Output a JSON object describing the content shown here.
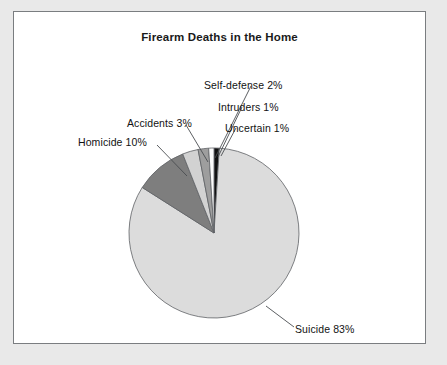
{
  "chart_data": {
    "type": "pie",
    "title": "Firearm Deaths in the Home",
    "xlabel": "",
    "ylabel": "",
    "legend_position": "none",
    "grid": false,
    "labels_as_callouts": true,
    "start_angle_deg": 0,
    "direction": "clockwise",
    "categories": [
      "Uncertain",
      "Suicide",
      "Homicide",
      "Accidents",
      "Self-defense",
      "Intruders"
    ],
    "values": [
      1,
      83,
      10,
      3,
      2,
      1
    ],
    "units": "percent",
    "slices": [
      {
        "name": "Uncertain",
        "value": 1,
        "label": "Uncertain 1%",
        "color": "#111111"
      },
      {
        "name": "Suicide",
        "value": 83,
        "label": "Suicide 83%",
        "color": "#dcdcdc"
      },
      {
        "name": "Homicide",
        "value": 10,
        "label": "Homicide 10%",
        "color": "#7e7e7e"
      },
      {
        "name": "Accidents",
        "value": 3,
        "label": "Accidents 3%",
        "color": "#d2d2d2"
      },
      {
        "name": "Self-defense",
        "value": 2,
        "label": "Self-defense 2%",
        "color": "#9e9e9e"
      },
      {
        "name": "Intruders",
        "value": 1,
        "label": "Intruders 1%",
        "color": "#fbfbfb"
      }
    ],
    "annotations": [
      "Self-defense 2%",
      "Intruders 1%",
      "Uncertain 1%",
      "Accidents 3%",
      "Homicide 10%",
      "Suicide 83%"
    ]
  },
  "figure": {
    "title": "Firearm Deaths in the Home",
    "border_color": "#7a7d80",
    "background_color": "#ffffff",
    "page_background_color": "#e9e9e9",
    "slice_outline_color": "#5e6165",
    "leader_line_color": "#4a4d50"
  },
  "callouts": {
    "self_defense": "Self-defense 2%",
    "intruders": "Intruders 1%",
    "uncertain": "Uncertain 1%",
    "accidents": "Accidents 3%",
    "homicide": "Homicide 10%",
    "suicide": "Suicide 83%"
  }
}
